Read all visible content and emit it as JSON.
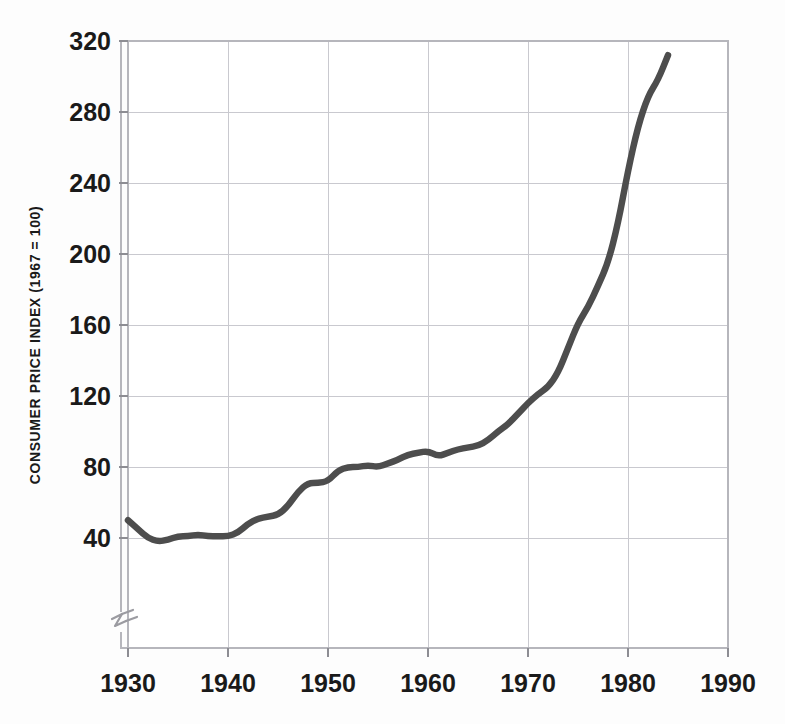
{
  "figure": {
    "background_color": "#fdfdfd",
    "plot_background_color": "#ffffff"
  },
  "axes": {
    "y_title": "CONSUMER PRICE INDEX (1967 = 100)",
    "x_title": "",
    "y_ticks": [
      "40",
      "80",
      "120",
      "160",
      "200",
      "240",
      "280",
      "320"
    ],
    "x_ticks": [
      "1930",
      "1940",
      "1950",
      "1960",
      "1970",
      "1980",
      "1990"
    ],
    "axis_break_note": "y-axis broken below 40"
  },
  "chart_data": {
    "type": "line",
    "title": "",
    "subtitle": "",
    "xlabel": "",
    "ylabel": "CONSUMER PRICE INDEX (1967 = 100)",
    "xlim": [
      1930,
      1990
    ],
    "ylim": [
      28,
      320
    ],
    "xtick_values": [
      1930,
      1940,
      1950,
      1960,
      1970,
      1980,
      1990
    ],
    "ytick_values": [
      40,
      80,
      120,
      160,
      200,
      240,
      280,
      320
    ],
    "grid": true,
    "legend": false,
    "legend_position": "none",
    "line_color": "#4d4d4d",
    "line_width": 6.5,
    "annotations": [
      "axis break (zigzag) on y-axis below 40"
    ],
    "series": [
      {
        "name": "Consumer Price Index",
        "x": [
          1930,
          1931,
          1932,
          1933,
          1934,
          1935,
          1936,
          1937,
          1938,
          1939,
          1940,
          1941,
          1942,
          1943,
          1944,
          1945,
          1946,
          1947,
          1948,
          1949,
          1950,
          1951,
          1952,
          1953,
          1954,
          1955,
          1956,
          1957,
          1958,
          1959,
          1960,
          1961,
          1962,
          1963,
          1964,
          1965,
          1966,
          1967,
          1968,
          1969,
          1970,
          1971,
          1972,
          1973,
          1974,
          1975,
          1976,
          1977,
          1978,
          1979,
          1980,
          1981,
          1982,
          1983,
          1984
        ],
        "values": [
          50,
          45,
          40,
          38,
          39,
          41,
          41,
          42,
          41,
          41,
          41,
          43,
          48,
          51,
          52,
          53,
          58,
          66,
          71,
          71,
          72,
          78,
          80,
          80,
          81,
          80,
          82,
          84,
          87,
          88,
          89,
          86,
          88,
          90,
          91,
          92,
          95,
          100,
          104,
          110,
          116,
          121,
          125,
          133,
          147,
          161,
          170,
          182,
          195,
          217,
          247,
          272,
          289,
          298,
          312
        ]
      }
    ]
  },
  "plot_geometry": {
    "left": 128,
    "right": 728,
    "top": 41,
    "bottom": 648,
    "y_value_at_top": 320,
    "y_pixels_per_40_units": 71,
    "y_break_pixel": 622
  }
}
